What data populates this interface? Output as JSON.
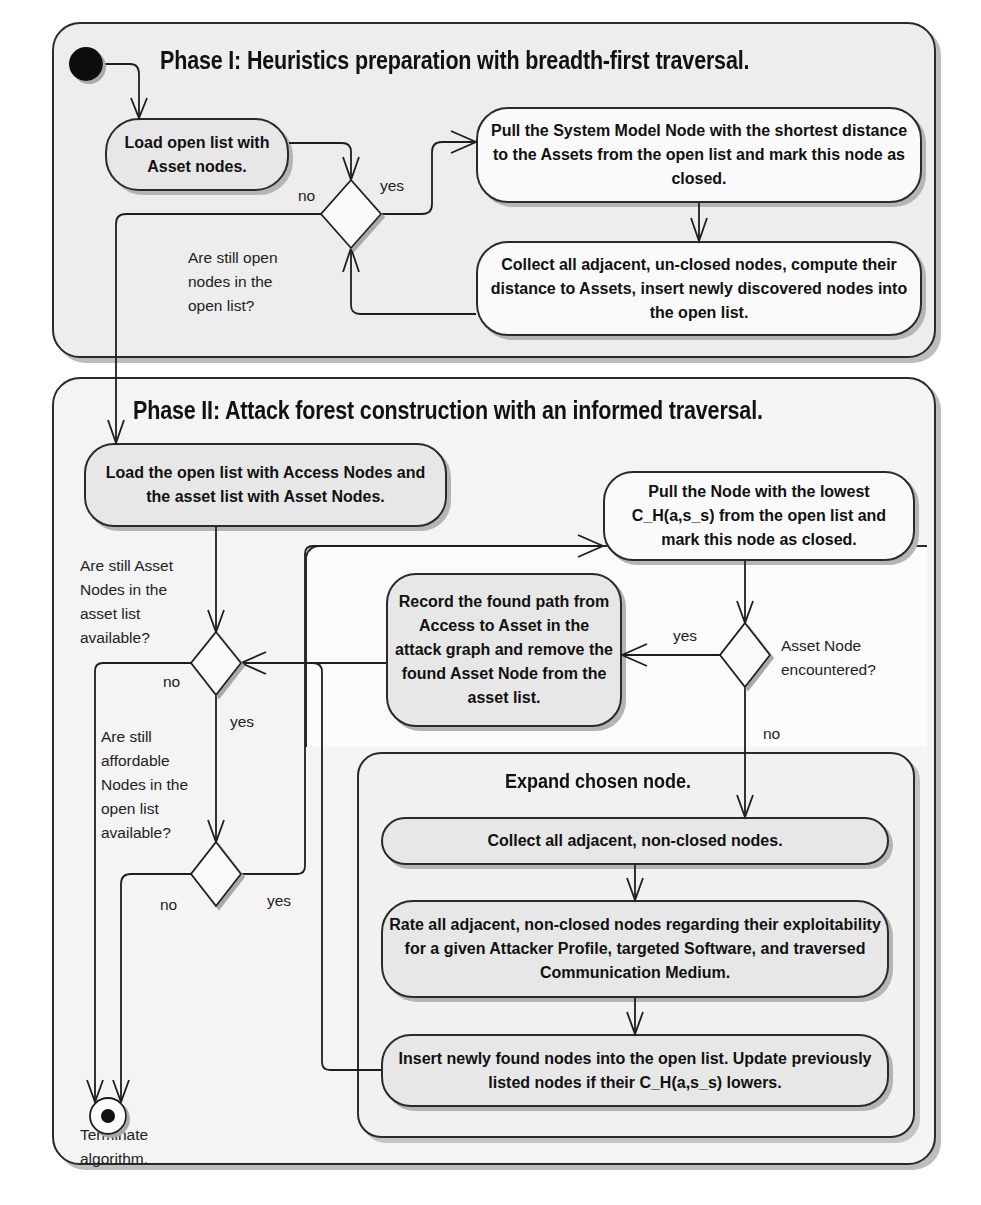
{
  "phase1": {
    "title": "Phase I: Heuristics preparation with breadth-first traversal.",
    "actions": {
      "load": "Load open list with Asset nodes.",
      "pull": "Pull the System Model Node with the shortest distance to the Assets from the open list and mark this node as closed.",
      "collect": "Collect all adjacent, un-closed nodes, compute their distance to Assets, insert newly discovered nodes into the open list."
    },
    "decision": {
      "question": "Are still open nodes in the open list?",
      "yes": "yes",
      "no": "no"
    }
  },
  "phase2": {
    "title": "Phase II: Attack forest construction with an informed traversal.",
    "actions": {
      "load": "Load the open list with Access Nodes and the asset list with Asset Nodes.",
      "pull": "Pull the Node with the lowest C_H(a,s_s) from the open list and mark this node as closed.",
      "record": "Record the found path from Access to Asset in the attack graph and remove the found Asset Node from the asset list."
    },
    "decision_assets": {
      "question": "Are still Asset Nodes in the asset list available?",
      "yes": "yes",
      "no": "no"
    },
    "decision_affordable": {
      "question": "Are still affordable Nodes in the open list available?",
      "yes": "yes",
      "no": "no"
    },
    "decision_encountered": {
      "question": "Asset Node encountered?",
      "yes": "yes",
      "no": "no"
    },
    "expand": {
      "title": "Expand chosen node.",
      "collect": "Collect all adjacent, non-closed nodes.",
      "rate": "Rate all adjacent, non-closed nodes regarding their exploitability for a given Attacker Profile, targeted Software, and traversed Communication Medium.",
      "insert": "Insert newly found nodes into the open list. Update previously listed nodes if their C_H(a,s_s) lowers."
    },
    "final": {
      "label": "Terminate algorithm."
    }
  }
}
